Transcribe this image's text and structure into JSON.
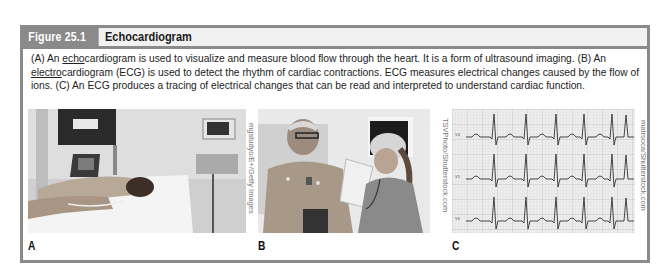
{
  "figure": {
    "number": "Figure 25.1",
    "title": "Echocardiogram",
    "caption": {
      "part1": "(A) An ",
      "echo_term": "echo",
      "part2": "cardiogram is used to visualize and measure blood flow through the heart. It is a form of ultrasound imaging. (B) An ",
      "electro_term": "electro",
      "part3": "cardiogram (ECG) is used to detect the rhythm of cardiac contractions. ECG measures electrical changes caused by the flow of ions. (C) An ECG produces a tracing of electrical changes that can be read and interpreted to understand cardiac function."
    },
    "panels": [
      {
        "label": "A",
        "description": "Patient lying on side receiving an echocardiogram with ultrasound machine monitors"
      },
      {
        "label": "B",
        "description": "Older male patient with ECG electrodes on chest talking with a nurse holding a clipboard"
      },
      {
        "label": "C",
        "description": "ECG tracing with three rhythm strips on grid paper"
      }
    ],
    "credits": {
      "b": "mgstudyo/E+/Getty Images",
      "c_left": "TSVPhoto/Shutterstock.com",
      "c_right": "matrsoca/Shutterstock.com"
    },
    "ecg_lead_labels": [
      "V4",
      "V5",
      "V6"
    ]
  },
  "colors": {
    "frame": "#8a8a8a",
    "header_bg": "#f1f1f1",
    "number_text": "#ffffff",
    "ecg_grid": "#c9c9c9",
    "ecg_trace": "#333333"
  }
}
